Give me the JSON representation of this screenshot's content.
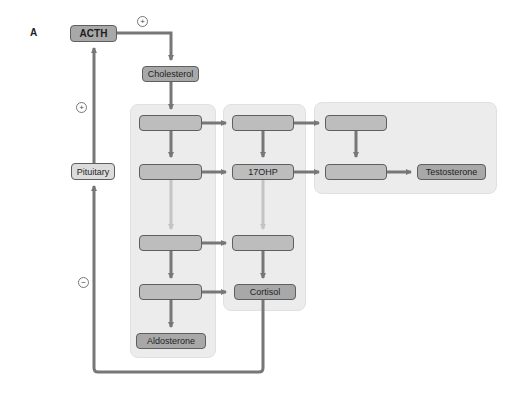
{
  "figure": {
    "panel_label": "A"
  },
  "nodes": {
    "acth": "ACTH",
    "cholesterol": "Cholesterol",
    "pituitary": "Pituitary",
    "ohp17": "17OHP",
    "cortisol": "Cortisol",
    "aldosterone": "Aldosterone",
    "testosterone": "Testosterone",
    "unlabeled": ""
  },
  "signs": {
    "acth_to_cholesterol": "+",
    "pituitary_to_acth": "+",
    "cortisol_feedback": "−"
  },
  "colors": {
    "arrow": "#777777",
    "arrow_faint": "#c4c4c4",
    "panel_bg": "#ececec",
    "node_fill": "#bdbdbd",
    "node_border": "#5f5f5f"
  }
}
